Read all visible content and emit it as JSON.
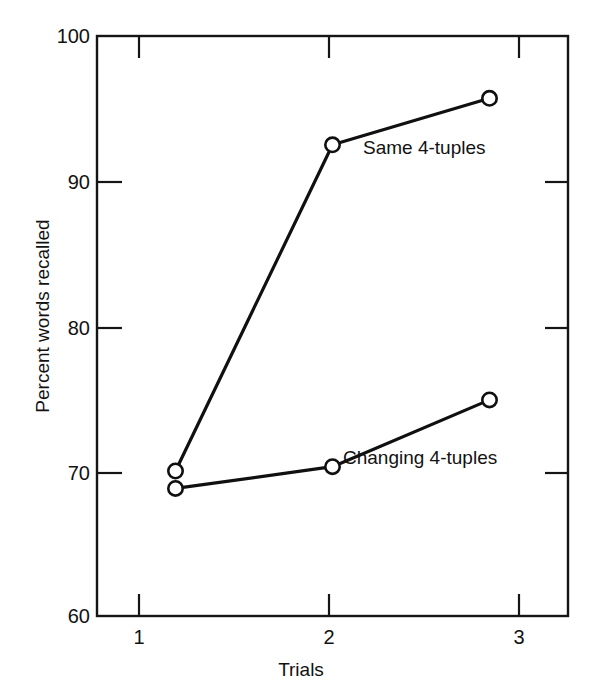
{
  "chart_data": {
    "type": "line",
    "title": "",
    "xlabel": "Trials",
    "ylabel": "Percent words recalled",
    "x": [
      1,
      2,
      3
    ],
    "categories": [
      "1",
      "2",
      "3"
    ],
    "xlim": [
      0.5,
      3.5
    ],
    "ylim": [
      60,
      100
    ],
    "xticks": [
      "1",
      "2",
      "3"
    ],
    "yticks": [
      "60",
      "70",
      "80",
      "90",
      "100"
    ],
    "grid": false,
    "legend_position": "inline-annotations",
    "series": [
      {
        "name": "Same 4-tuples",
        "values": [
          70.0,
          92.5,
          95.7
        ],
        "marker": "open-circle",
        "color": "#101010"
      },
      {
        "name": "Changing 4-tuples",
        "values": [
          68.8,
          70.3,
          74.9
        ],
        "marker": "open-circle",
        "color": "#101010"
      }
    ],
    "annotations": [
      {
        "text": "Same 4-tuples",
        "series": "Same 4-tuples"
      },
      {
        "text": "Changing 4-tuples",
        "series": "Changing 4-tuples"
      }
    ]
  },
  "axes": {
    "y_tick_labels": [
      "100",
      "90",
      "80",
      "70",
      "60"
    ],
    "x_tick_labels": [
      "1",
      "2",
      "3"
    ],
    "y_title": "Percent words recalled",
    "x_title": "Trials"
  },
  "colors": {
    "background": "#ffffff",
    "axis": "#151515",
    "line": "#101010",
    "marker_fill": "#ffffff",
    "text": "#121212"
  }
}
